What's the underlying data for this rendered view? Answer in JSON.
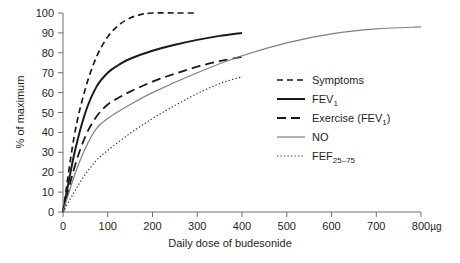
{
  "chart_data": {
    "type": "line",
    "title": "",
    "xlabel": "Daily dose of budesonide",
    "xunit": "µg",
    "ylabel": "% of maximum",
    "xlim": [
      0,
      800
    ],
    "ylim": [
      0,
      100
    ],
    "xticks": [
      "0",
      "100",
      "200",
      "300",
      "400",
      "500",
      "600",
      "700",
      "800"
    ],
    "yticks": [
      "0",
      "10",
      "20",
      "30",
      "40",
      "50",
      "60",
      "70",
      "80",
      "90",
      "100"
    ],
    "grid": false,
    "legend_position": "center-right",
    "series": [
      {
        "name": "Symptoms",
        "label": "Symptoms",
        "style": "dashed",
        "color": "#1a1a1a",
        "x": [
          0,
          25,
          50,
          75,
          100,
          125,
          150,
          175,
          200,
          250,
          300
        ],
        "y": [
          0,
          38,
          62,
          78,
          88,
          94,
          97.5,
          99.3,
          100,
          100,
          100
        ]
      },
      {
        "name": "FEV1",
        "label": "FEV",
        "label_sub": "1",
        "style": "solid",
        "color": "#1a1a1a",
        "x": [
          0,
          25,
          50,
          75,
          100,
          125,
          150,
          200,
          250,
          300,
          350,
          400
        ],
        "y": [
          0,
          29,
          50,
          63,
          70,
          74,
          77,
          81,
          84,
          86.5,
          88.5,
          90
        ]
      },
      {
        "name": "Exercise (FEV1)",
        "label": "Exercise (FEV",
        "label_sub": "1",
        "label_tail": ")",
        "style": "dashed-long",
        "color": "#1a1a1a",
        "x": [
          0,
          25,
          50,
          75,
          100,
          125,
          150,
          200,
          250,
          300,
          350,
          400
        ],
        "y": [
          0,
          22,
          38,
          48,
          54,
          57.5,
          60.5,
          65.5,
          69.5,
          73,
          75.8,
          78
        ]
      },
      {
        "name": "NO",
        "label": "NO",
        "style": "solid-thin",
        "color": "#808080",
        "x": [
          0,
          25,
          50,
          75,
          100,
          150,
          200,
          300,
          400,
          500,
          600,
          700,
          800
        ],
        "y": [
          0,
          18,
          32,
          42,
          47,
          54,
          60,
          70,
          78.5,
          85,
          89.5,
          92,
          93
        ]
      },
      {
        "name": "FEF25-75",
        "label": "FEF",
        "label_sub": "25–75",
        "style": "dotted",
        "color": "#333333",
        "x": [
          0,
          25,
          50,
          75,
          100,
          150,
          200,
          250,
          300,
          350,
          400
        ],
        "y": [
          0,
          10,
          19,
          26,
          31,
          39.5,
          47,
          53.5,
          59.5,
          64.5,
          68
        ]
      }
    ]
  }
}
